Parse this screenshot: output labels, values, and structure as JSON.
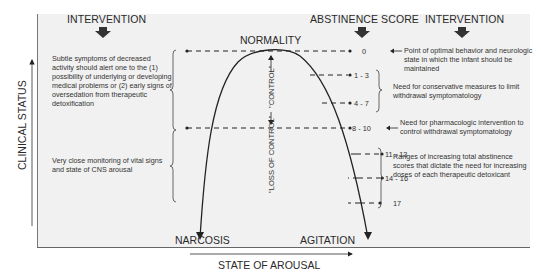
{
  "axes": {
    "y_label": "CLINICAL STATUS",
    "x_label": "STATE OF AROUSAL"
  },
  "headers": {
    "left_intervention": "INTERVENTION",
    "abstinence_score": "ABSTINENCE SCORE",
    "right_intervention": "INTERVENTION"
  },
  "curve_labels": {
    "top": "NORMALITY",
    "left_end": "NARCOSIS",
    "right_end": "AGITATION",
    "control": "\"CONTROL\"",
    "loss_of_control": "\"LOSS OF CONTROL\""
  },
  "left_notes": [
    "Subtle symptoms of decreased activity should alert one to the (1) possibility of underlying or developing medical problems or (2) early signs of oversedation from therapeutic detoxification",
    "Very close monitoring of vital signs and state of CNS arousal"
  ],
  "scores": [
    "0",
    "1 - 3",
    "4 - 7",
    "8 - 10",
    "11 - 13",
    "14 - 16",
    "17"
  ],
  "right_notes": [
    "Point of optimal behavior and neurologic state in which the infant should be maintained",
    "Need for conservative measures to limit withdrawal symptomatology",
    "Need for pharmacologic intervention to control withdrawal symptomatology",
    "Ranges of increasing total abstinence scores that dictate the need for increasing doses of each therapeutic detoxicant"
  ],
  "colors": {
    "panel_bg": "#f1f1f1",
    "ink": "#2a2a2a"
  }
}
